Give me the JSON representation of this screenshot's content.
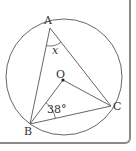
{
  "diagram": {
    "type": "inscribed-angle",
    "points": {
      "A": {
        "label": "A",
        "x": 50,
        "y": 28
      },
      "B": {
        "label": "B",
        "x": 30,
        "y": 124
      },
      "C": {
        "label": "C",
        "x": 111,
        "y": 106
      },
      "O": {
        "label": "O",
        "x": 63,
        "y": 80
      }
    },
    "circle": {
      "cx": 64,
      "cy": 77,
      "r": 58
    },
    "angles": {
      "at_A": {
        "label": "x"
      },
      "OBC": {
        "label": "38°"
      }
    },
    "colors": {
      "line": "#555555",
      "frame": "#8a8a8a"
    }
  }
}
